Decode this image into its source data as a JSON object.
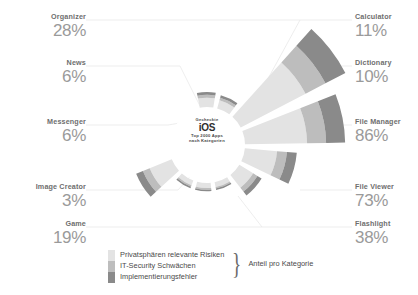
{
  "hub": {
    "line1": "Gecheckte",
    "line2": "iOS",
    "line3": "Top 2000 Apps",
    "line4": "nach Kategorien"
  },
  "legend": {
    "items": [
      {
        "label": "Privatsphären relevante Risiken",
        "color": "#e3e3e3"
      },
      {
        "label": "IT-Security Schwächen",
        "color": "#bdbdbd"
      },
      {
        "label": "Implementierungsfehler",
        "color": "#8a8a8a"
      }
    ],
    "bracket_label": "Anteil pro Kategorie",
    "brace_glyph": "}"
  },
  "chart_data": {
    "type": "pie",
    "title": "Gecheckte iOS Top 2000 Apps nach Kategorien",
    "xlabel": "",
    "ylabel": "Anteil pro Kategorie",
    "legend_position": "bottom-left",
    "grid": false,
    "categories": [
      "Calculator",
      "Dictionary",
      "File Manager",
      "File Viewer",
      "Flashlight",
      "Game",
      "Image Creator",
      "Messenger",
      "News",
      "Organizer"
    ],
    "values": [
      11,
      10,
      86,
      73,
      38,
      19,
      3,
      6,
      6,
      28
    ],
    "value_suffix": "%",
    "series": [
      {
        "name": "Privatsphären relevante Risiken",
        "color": "#e3e3e3"
      },
      {
        "name": "IT-Security Schwächen",
        "color": "#bdbdbd"
      },
      {
        "name": "Implementierungsfehler",
        "color": "#8a8a8a"
      }
    ],
    "slices": [
      {
        "label": "Calculator",
        "value": 11,
        "display": "11%"
      },
      {
        "label": "Dictionary",
        "value": 10,
        "display": "10%"
      },
      {
        "label": "File Manager",
        "value": 86,
        "display": "86%"
      },
      {
        "label": "File Viewer",
        "value": 73,
        "display": "73%"
      },
      {
        "label": "Flashlight",
        "value": 38,
        "display": "38%"
      },
      {
        "label": "Game",
        "value": 19,
        "display": "19%"
      },
      {
        "label": "Image Creator",
        "value": 3,
        "display": "3%"
      },
      {
        "label": "Messenger",
        "value": 6,
        "display": "6%"
      },
      {
        "label": "News",
        "value": 6,
        "display": "6%"
      },
      {
        "label": "Organizer",
        "value": 28,
        "display": "28%"
      }
    ]
  },
  "labels": {
    "left": [
      {
        "name": "Organizer",
        "value": "28%"
      },
      {
        "name": "News",
        "value": "6%"
      },
      {
        "name": "Messenger",
        "value": "6%"
      },
      {
        "name": "Image Creator",
        "value": "3%"
      },
      {
        "name": "Game",
        "value": "19%"
      }
    ],
    "right": [
      {
        "name": "Calculator",
        "value": "11%"
      },
      {
        "name": "Dictionary",
        "value": "10%"
      },
      {
        "name": "File Manager",
        "value": "86%"
      },
      {
        "name": "File Viewer",
        "value": "73%"
      },
      {
        "name": "Flashlight",
        "value": "38%"
      }
    ]
  }
}
